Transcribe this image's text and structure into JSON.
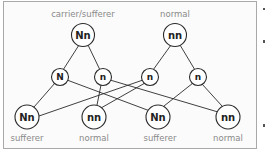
{
  "diagram": {
    "type": "genetic-inheritance-cross",
    "parents": [
      {
        "id": "parent1",
        "genotype": "Nn",
        "phenotype": "carrier/sufferer"
      },
      {
        "id": "parent2",
        "genotype": "nn",
        "phenotype": "normal"
      }
    ],
    "gametes": [
      {
        "id": "g1",
        "allele": "N",
        "from": "parent1"
      },
      {
        "id": "g2",
        "allele": "n",
        "from": "parent1"
      },
      {
        "id": "g3",
        "allele": "n",
        "from": "parent2"
      },
      {
        "id": "g4",
        "allele": "n",
        "from": "parent2"
      }
    ],
    "offspring": [
      {
        "id": "o1",
        "genotype": "Nn",
        "phenotype": "sufferer"
      },
      {
        "id": "o2",
        "genotype": "nn",
        "phenotype": "normal"
      },
      {
        "id": "o3",
        "genotype": "Nn",
        "phenotype": "sufferer"
      },
      {
        "id": "o4",
        "genotype": "nn",
        "phenotype": "normal"
      }
    ],
    "edges": [
      [
        "parent1",
        "g1"
      ],
      [
        "parent1",
        "g2"
      ],
      [
        "parent2",
        "g3"
      ],
      [
        "parent2",
        "g4"
      ],
      [
        "g1",
        "o1"
      ],
      [
        "g1",
        "o3"
      ],
      [
        "g2",
        "o2"
      ],
      [
        "g2",
        "o4"
      ],
      [
        "g3",
        "o1"
      ],
      [
        "g3",
        "o2"
      ],
      [
        "g4",
        "o3"
      ],
      [
        "g4",
        "o4"
      ]
    ]
  },
  "labels": {
    "parent1_genotype": "Nn",
    "parent1_phenotype": "carrier/sufferer",
    "parent2_genotype": "nn",
    "parent2_phenotype": "normal",
    "g1": "N",
    "g2": "n",
    "g3": "n",
    "g4": "n",
    "o1_genotype": "Nn",
    "o1_phenotype": "sufferer",
    "o2_genotype": "nn",
    "o2_phenotype": "normal",
    "o3_genotype": "Nn",
    "o3_phenotype": "sufferer",
    "o4_genotype": "nn",
    "o4_phenotype": "normal"
  },
  "colors": {
    "border": "#a9a9a9",
    "lines": "#2a2a2a",
    "caption": "#8a8a8a",
    "node_text": "#222222"
  }
}
